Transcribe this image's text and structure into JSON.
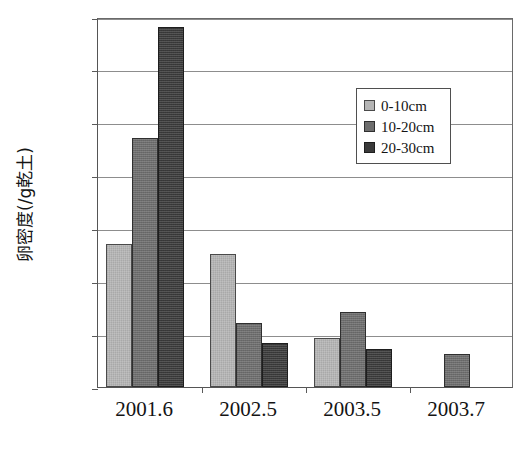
{
  "chart_data": {
    "type": "bar",
    "title": "",
    "xlabel": "",
    "ylabel": "卵密度(/g乾土)",
    "ylim": [
      0,
      350
    ],
    "yticks": [
      0,
      50,
      100,
      150,
      200,
      250,
      300,
      350
    ],
    "ytick_labels": [
      "0",
      "50",
      "100",
      "150",
      "200",
      "250",
      "300",
      "350"
    ],
    "grid": "horizontal",
    "legend_position": "upper-right",
    "categories": [
      "2001.6",
      "2002.5",
      "2003.5",
      "2003.7"
    ],
    "series": [
      {
        "name": "0-10cm",
        "color": "#b5b5b5",
        "values": [
          135,
          126,
          46,
          null
        ]
      },
      {
        "name": "10-20cm",
        "color": "#6d6d6d",
        "values": [
          236,
          61,
          71,
          31
        ]
      },
      {
        "name": "20-30cm",
        "color": "#3a3a3a",
        "values": [
          341,
          42,
          36,
          null
        ]
      }
    ]
  },
  "legend": {
    "entries": [
      {
        "label": "0-10cm"
      },
      {
        "label": "10-20cm"
      },
      {
        "label": "20-30cm"
      }
    ]
  },
  "caption": {
    "text": ""
  }
}
